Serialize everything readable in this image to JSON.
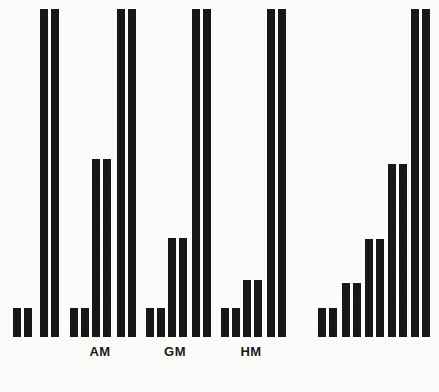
{
  "chart_data": {
    "type": "bar",
    "title": "",
    "subtitle": "",
    "xlabel": "",
    "ylabel": "",
    "grid": false,
    "legend": "none",
    "axis_visible": false,
    "ylim": [
      0,
      100
    ],
    "bar_color": "#181818",
    "background_color": "#fdfdfc",
    "orientation": "vertical",
    "paired_bars": true,
    "note": "Each plotted category is drawn as a pair of identical adjacent bars; four groups of bars, three of which are labelled AM, GM and HM.",
    "categories": [
      "group-1-short",
      "group-1-tall",
      "AM-short",
      "AM-medium",
      "AM-tall",
      "GM-short",
      "GM-medium",
      "GM-tall",
      "HM-short",
      "HM-medium",
      "HM-tall",
      "right-1",
      "right-2",
      "right-3",
      "right-4",
      "right-5"
    ],
    "values": [
      10,
      100,
      10,
      55,
      100,
      10,
      30,
      100,
      10,
      18,
      100,
      10,
      17,
      30,
      53,
      100
    ],
    "groups": [
      {
        "name": "group-1",
        "label": "",
        "bars": [
          {
            "id": "g1-b1",
            "value": 10,
            "x": 13,
            "top": 308,
            "pair_gap": 3
          },
          {
            "id": "g1-b2",
            "value": 100,
            "x": 40,
            "top": 9,
            "pair_gap": 3
          }
        ]
      },
      {
        "name": "group-2",
        "label": "AM",
        "label_x": 100,
        "bars": [
          {
            "id": "am-b1",
            "value": 10,
            "x": 70,
            "top": 308,
            "pair_gap": 3
          },
          {
            "id": "am-b2",
            "value": 55,
            "x": 92,
            "top": 159,
            "pair_gap": 3
          },
          {
            "id": "am-b3",
            "value": 100,
            "x": 117,
            "top": 9,
            "pair_gap": 3
          }
        ]
      },
      {
        "name": "group-3",
        "label": "GM",
        "label_x": 175,
        "bars": [
          {
            "id": "gm-b1",
            "value": 10,
            "x": 146,
            "top": 308,
            "pair_gap": 3
          },
          {
            "id": "gm-b2",
            "value": 30,
            "x": 168,
            "top": 238,
            "pair_gap": 3
          },
          {
            "id": "gm-b3",
            "value": 100,
            "x": 192,
            "top": 9,
            "pair_gap": 3
          }
        ]
      },
      {
        "name": "group-4",
        "label": "HM",
        "label_x": 251,
        "bars": [
          {
            "id": "hm-b1",
            "value": 10,
            "x": 221,
            "top": 308,
            "pair_gap": 3
          },
          {
            "id": "hm-b2",
            "value": 18,
            "x": 243,
            "top": 280,
            "pair_gap": 3
          },
          {
            "id": "hm-b3",
            "value": 100,
            "x": 267,
            "top": 9,
            "pair_gap": 3
          }
        ]
      },
      {
        "name": "group-5",
        "label": "",
        "bars": [
          {
            "id": "r-b1",
            "value": 10,
            "x": 318,
            "top": 308,
            "pair_gap": 3
          },
          {
            "id": "r-b2",
            "value": 17,
            "x": 342,
            "top": 283,
            "pair_gap": 3
          },
          {
            "id": "r-b3",
            "value": 30,
            "x": 365,
            "top": 239,
            "pair_gap": 3
          },
          {
            "id": "r-b4",
            "value": 53,
            "x": 388,
            "top": 164,
            "pair_gap": 3
          },
          {
            "id": "r-b5",
            "value": 100,
            "x": 411,
            "top": 9,
            "pair_gap": 3
          }
        ]
      }
    ],
    "baseline_y": 337,
    "bar_width": 8,
    "labels": [
      {
        "text": "AM",
        "x": 100,
        "y": 344
      },
      {
        "text": "GM",
        "x": 175,
        "y": 344
      },
      {
        "text": "HM",
        "x": 251,
        "y": 344
      }
    ]
  }
}
